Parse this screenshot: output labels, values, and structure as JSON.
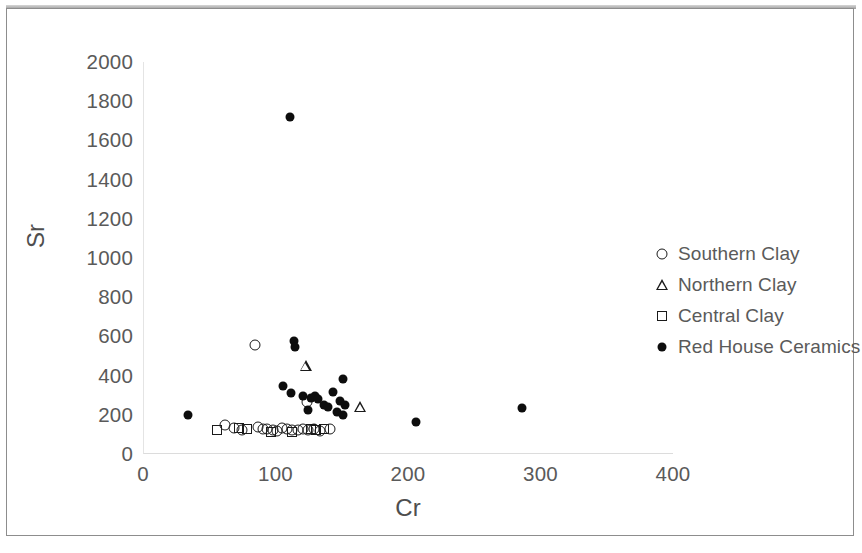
{
  "chart_data": {
    "type": "scatter",
    "title": "",
    "xlabel": "Cr",
    "ylabel": "Sr",
    "xlim": [
      0,
      400
    ],
    "ylim": [
      0,
      2000
    ],
    "xticks": [
      "0",
      "100",
      "200",
      "300",
      "400"
    ],
    "yticks": [
      "0",
      "200",
      "400",
      "600",
      "800",
      "1000",
      "1200",
      "1400",
      "1600",
      "1800",
      "2000"
    ],
    "xtick_values": [
      0,
      100,
      200,
      300,
      400
    ],
    "ytick_values": [
      0,
      200,
      400,
      600,
      800,
      1000,
      1200,
      1400,
      1600,
      1800,
      2000
    ],
    "grid": false,
    "legend_position": "right",
    "series": [
      {
        "name": "Southern Clay",
        "marker": "open-circle",
        "color": "#1a1a1a",
        "points": [
          [
            84,
            555
          ],
          [
            61,
            150
          ],
          [
            68,
            135
          ],
          [
            74,
            120
          ],
          [
            86,
            140
          ],
          [
            90,
            130
          ],
          [
            93,
            128
          ],
          [
            97,
            122
          ],
          [
            100,
            118
          ],
          [
            104,
            135
          ],
          [
            108,
            128
          ],
          [
            112,
            125
          ],
          [
            116,
            120
          ],
          [
            120,
            130
          ],
          [
            124,
            120
          ],
          [
            128,
            126
          ],
          [
            133,
            118
          ],
          [
            140,
            130
          ],
          [
            123,
            265
          ]
        ]
      },
      {
        "name": "Northern Clay",
        "marker": "open-triangle",
        "color": "#1a1a1a",
        "points": [
          [
            122,
            450
          ],
          [
            163,
            240
          ]
        ]
      },
      {
        "name": "Central Clay",
        "marker": "open-square",
        "color": "#1a1a1a",
        "points": [
          [
            55,
            120
          ],
          [
            72,
            132
          ],
          [
            78,
            128
          ],
          [
            96,
            112
          ],
          [
            112,
            112
          ],
          [
            126,
            128
          ],
          [
            130,
            125
          ],
          [
            136,
            128
          ]
        ]
      },
      {
        "name": "Red House Ceramics",
        "marker": "filled-circle",
        "color": "#0d0d0d",
        "points": [
          [
            110,
            1718
          ],
          [
            33,
            198
          ],
          [
            113,
            578
          ],
          [
            114,
            548
          ],
          [
            105,
            348
          ],
          [
            111,
            310
          ],
          [
            120,
            295
          ],
          [
            126,
            285
          ],
          [
            129,
            298
          ],
          [
            131,
            282
          ],
          [
            124,
            222
          ],
          [
            136,
            252
          ],
          [
            139,
            238
          ],
          [
            143,
            318
          ],
          [
            148,
            270
          ],
          [
            150,
            382
          ],
          [
            152,
            248
          ],
          [
            146,
            212
          ],
          [
            150,
            198
          ],
          [
            205,
            163
          ],
          [
            285,
            233
          ]
        ]
      }
    ]
  },
  "legend": {
    "items": [
      {
        "label": "Southern Clay",
        "marker": "open-circle-icon"
      },
      {
        "label": "Northern Clay",
        "marker": "open-triangle-icon"
      },
      {
        "label": "Central Clay",
        "marker": "open-square-icon"
      },
      {
        "label": "Red House Ceramics",
        "marker": "filled-circle-icon"
      }
    ]
  }
}
